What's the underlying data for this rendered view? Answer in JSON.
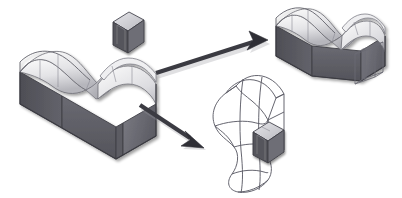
{
  "figure": {
    "kind": "cad-boolean-operation-diagram",
    "background_color": "#ffffff",
    "width": 402,
    "height": 198,
    "title": "",
    "caption": ""
  },
  "palette": {
    "outline": "#4a4a52",
    "outline_light": "#6f6f78",
    "wireframe": "#5a5a64",
    "solid_dark_face": "#55555c",
    "solid_mid_face": "#6a6a72",
    "solid_front_face": "#5f5f67",
    "surface_light": "#f2f2f2",
    "surface_shadow": "#b9b9bf",
    "surface_mid": "#d6d6da",
    "arrow_color": "#3b3b42",
    "arrow_shadow": "#b5b5bb",
    "tool_top": "#c9c9cf",
    "tool_front": "#54545b",
    "tool_side": "#74747c"
  },
  "objects": [
    {
      "id": "source-block",
      "data_name": "source-wavy-block",
      "label": "Source block with undulating top surface",
      "render": "shaded-solid",
      "position": {
        "x": 18,
        "y": 62,
        "w": 140,
        "h": 82
      }
    },
    {
      "id": "tool-box",
      "data_name": "tool-box",
      "label": "Small rectangular tool box",
      "render": "shaded-solid",
      "position": {
        "x": 112,
        "y": 11,
        "w": 32,
        "h": 43
      }
    },
    {
      "id": "result-shaded",
      "data_name": "result-shaded-block",
      "label": "Resulting block with wireframe box extension",
      "render": "shaded-solid-with-wireframe",
      "position": {
        "x": 272,
        "y": 14,
        "w": 122,
        "h": 78
      }
    },
    {
      "id": "result-wireframe",
      "data_name": "result-wireframe-surface",
      "label": "Resulting wireframe curved surface with solid tool box",
      "render": "wireframe",
      "position": {
        "x": 208,
        "y": 72,
        "w": 110,
        "h": 118
      }
    }
  ],
  "arrows": [
    {
      "id": "arrow-up-right",
      "data_name": "arrow-to-shaded-result",
      "label": "",
      "from": {
        "x": 156,
        "y": 70
      },
      "to": {
        "x": 262,
        "y": 38
      },
      "direction": "up-right"
    },
    {
      "id": "arrow-down-right",
      "data_name": "arrow-to-wireframe-result",
      "label": "",
      "from": {
        "x": 140,
        "y": 104
      },
      "to": {
        "x": 204,
        "y": 148
      },
      "direction": "down-right"
    }
  ],
  "annotations": []
}
